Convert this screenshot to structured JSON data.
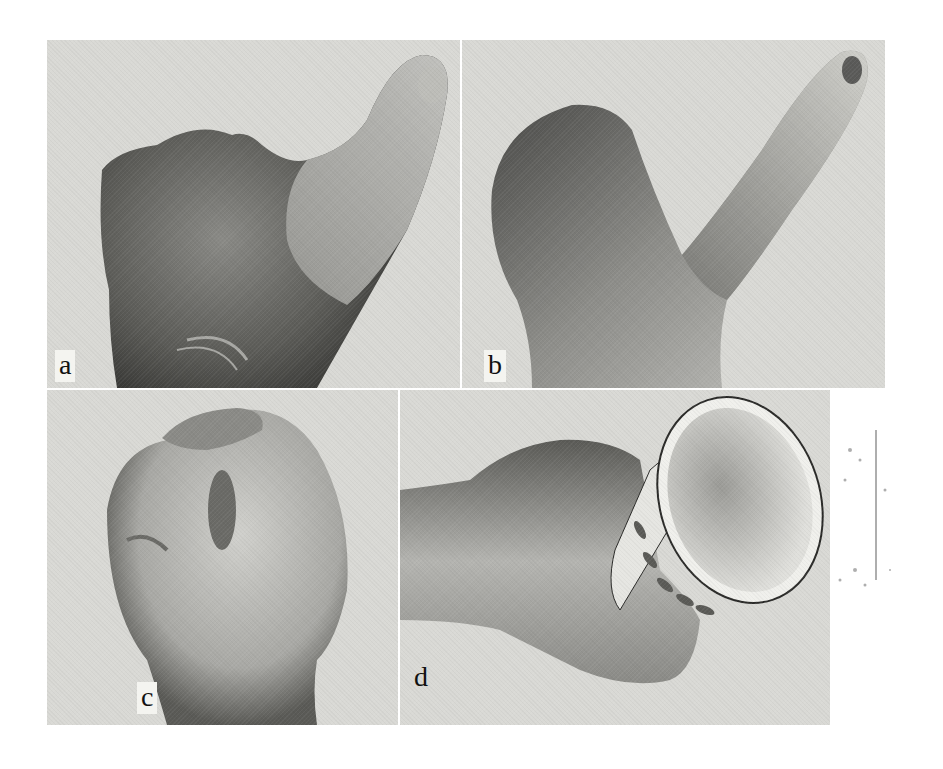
{
  "figure": {
    "panels": [
      {
        "id": "a",
        "label": "a",
        "description": "Hand with reconstructed thumb, dorsal-radial view, thumb pointing up"
      },
      {
        "id": "b",
        "label": "b",
        "description": "Hand with reconstructed thumb, side view, thumb extended diagonally"
      },
      {
        "id": "c",
        "label": "c",
        "description": "Hand with thumb flexed across palm, making fist"
      },
      {
        "id": "d",
        "label": "d",
        "description": "Hand grasping a paper cup with leaf pattern"
      }
    ]
  }
}
